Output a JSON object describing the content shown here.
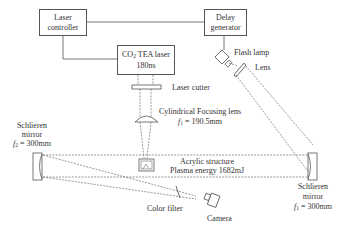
{
  "diagram": {
    "type": "optical schlieren experimental setup",
    "boxes": {
      "laser_controller": {
        "line1": "Laser",
        "line2": "controller"
      },
      "delay_generator": {
        "line1": "Delay",
        "line2": "generator"
      },
      "co2_laser": {
        "line1_prefix": "CO",
        "line1_sub": "2",
        "line1_suffix": " TEA laser",
        "line2": "180ns"
      }
    },
    "labels": {
      "flash_lamp": "Flash lamp",
      "lens": "Lens",
      "laser_cutter": "Laser cutter",
      "focusing_lens": "Cylindrical Focusing lens",
      "focusing_lens_f_var": "f",
      "focusing_lens_f_sub": "1",
      "focusing_lens_f_value": " = 190.5mm",
      "acrylic": "Acrylic structure",
      "plasma": "Plasma energy 1682mJ",
      "left_mirror_line1": "Schlieren",
      "left_mirror_line2": "mirror",
      "left_mirror_f_var": "f",
      "left_mirror_f_sub": "2",
      "left_mirror_f_value": " = 300mm",
      "right_mirror_line1": "Schlieren",
      "right_mirror_line2": "mirror",
      "right_mirror_f_var": "f",
      "right_mirror_f_sub": "1",
      "right_mirror_f_value": " = 300mm",
      "color_filter": "Color filter",
      "camera": "Camera"
    },
    "colors": {
      "line": "#555555",
      "text": "#333333",
      "background": "#ffffff"
    }
  }
}
